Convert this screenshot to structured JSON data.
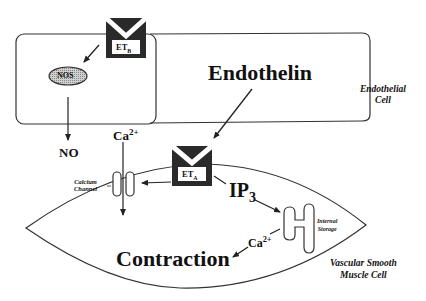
{
  "diagram": {
    "title": "Endothelin",
    "endothelial_cell": {
      "label_line1": "Endothelial",
      "label_line2": "Cell"
    },
    "smooth_muscle_cell": {
      "label_line1": "Vascular Smooth",
      "label_line2": "Muscle Cell"
    },
    "receptor_b": {
      "label": "ET",
      "subscript": "B"
    },
    "receptor_a": {
      "label": "ET",
      "subscript": "A"
    },
    "nos": "NOS",
    "no": "NO",
    "calcium_top": {
      "label": "Ca",
      "superscript": "2+"
    },
    "calcium_bottom": {
      "label": "Ca",
      "superscript": "2+"
    },
    "calcium_channel": {
      "line1": "Calcium",
      "line2": "Channel"
    },
    "ip3": {
      "label": "IP",
      "subscript": "3"
    },
    "internal_storage": {
      "line1": "Internal",
      "line2": "Storage"
    },
    "contraction": "Contraction",
    "colors": {
      "stroke": "#222222",
      "receptor_fill": "#2a2a2a",
      "nos_fill": "#bdbdbd"
    }
  }
}
